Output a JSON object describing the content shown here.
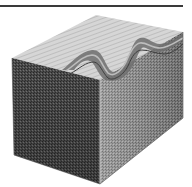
{
  "illustration": {
    "subject": "cross-section block illustration",
    "style": "engraving",
    "colors": {
      "background": "#ffffff",
      "rule_line": "#3a3a3a",
      "top_face": "#c9c9c9",
      "left_face": "#4a4a4a",
      "right_face": "#8a8a8a",
      "fold": "#6e6e6e",
      "fold_highlight": "#bdbdbd"
    }
  }
}
